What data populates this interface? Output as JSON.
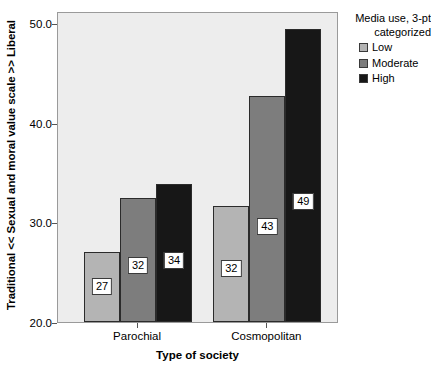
{
  "chart_data": {
    "type": "bar",
    "title": "",
    "xlabel": "Type of society",
    "ylabel": "Traditional << Sexual and moral value scale >> Liberal",
    "categories": [
      "Parochial",
      "Cosmopolitan"
    ],
    "series": [
      {
        "name": "Low",
        "color": "#b4b4b4",
        "values": [
          27.0,
          31.6
        ],
        "labels": [
          "27",
          "32"
        ]
      },
      {
        "name": "Moderate",
        "color": "#7d7d7d",
        "values": [
          32.4,
          42.7
        ],
        "labels": [
          "32",
          "43"
        ]
      },
      {
        "name": "High",
        "color": "#171717",
        "values": [
          33.8,
          49.4
        ],
        "labels": [
          "34",
          "49"
        ]
      }
    ],
    "ylim": [
      20.0,
      51.2
    ],
    "yticks": [
      20.0,
      30.0,
      40.0,
      50.0
    ],
    "ytick_labels": [
      "20.0",
      "30.0",
      "40.0",
      "50.0"
    ],
    "grid": false,
    "legend_position": "right",
    "plot_background": "#ededed"
  },
  "legend": {
    "title_line1": "Media use, 3-pt",
    "title_line2": "categorized",
    "entries": [
      {
        "label": "Low"
      },
      {
        "label": "Moderate"
      },
      {
        "label": "High"
      }
    ]
  }
}
